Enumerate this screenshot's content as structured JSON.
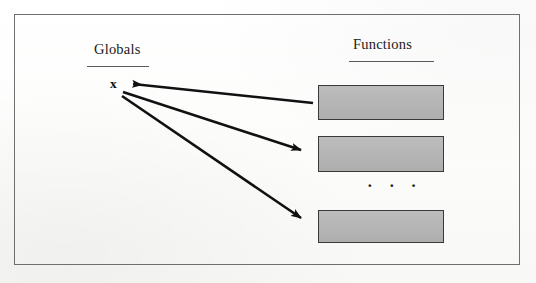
{
  "figure": {
    "kind": "diagram",
    "caption_text": "",
    "background_color": "#fdfdfc",
    "frame_color": "#6f6f6f"
  },
  "columns": {
    "globals": {
      "heading": "Globals",
      "rule_color": "#5a5a5a"
    },
    "functions": {
      "heading": "Functions",
      "rule_color": "#5a5a5a"
    }
  },
  "globals_column": {
    "variables": [
      {
        "name": "x",
        "label": "x"
      }
    ]
  },
  "functions_column": {
    "box_fill_color": "#b5b5b5",
    "box_border_color": "#3a3a3a",
    "boxes": [
      {
        "id": "function-box-1",
        "label": ""
      },
      {
        "id": "function-box-2",
        "label": ""
      },
      {
        "id": "function-box-3",
        "label": ""
      }
    ],
    "ellipsis": "· · ·"
  },
  "arrows": {
    "stroke_color": "#111111",
    "items": [
      {
        "id": "arrow-fn1-to-x",
        "from": "function-box-1",
        "to": "global-variable-x",
        "direction": "left",
        "x1": 313,
        "y1": 103,
        "x2": 129,
        "y2": 83
      },
      {
        "id": "arrow-x-to-fn2",
        "from": "global-variable-x",
        "to": "function-box-2",
        "direction": "right",
        "x1": 123,
        "y1": 92,
        "x2": 306,
        "y2": 152
      },
      {
        "id": "arrow-x-to-fn3",
        "from": "global-variable-x",
        "to": "function-box-3",
        "direction": "right",
        "x1": 122,
        "y1": 96,
        "x2": 306,
        "y2": 221
      }
    ]
  }
}
